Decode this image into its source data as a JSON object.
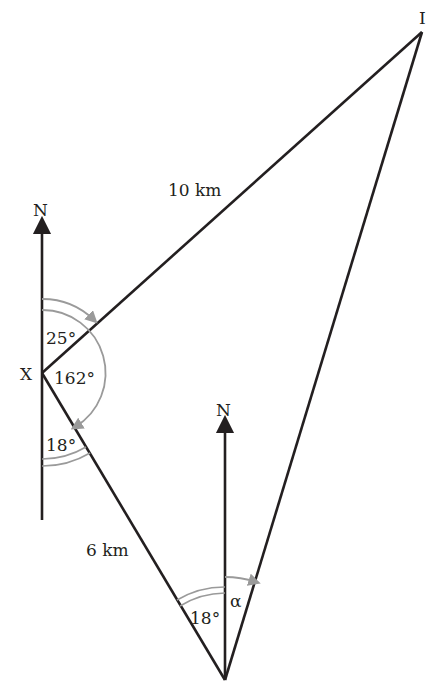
{
  "diagram": {
    "type": "bearing-triangle",
    "points": {
      "X": {
        "label": "X"
      },
      "top": {
        "label": "I"
      },
      "bottom": {
        "label": ""
      }
    },
    "north_labels": [
      "N",
      "N"
    ],
    "sides": {
      "X_to_top": "10 km",
      "X_to_bottom": "6 km"
    },
    "angles": {
      "at_X_north_to_top": "25°",
      "at_X_north_clockwise_to_bottom": "162°",
      "at_X_south_to_bottom": "18°",
      "at_bottom_X_side": "18°",
      "at_bottom_unknown": "α"
    },
    "colors": {
      "line": "#231f20",
      "arc": "#9a9a9a",
      "background": "#ffffff"
    }
  }
}
